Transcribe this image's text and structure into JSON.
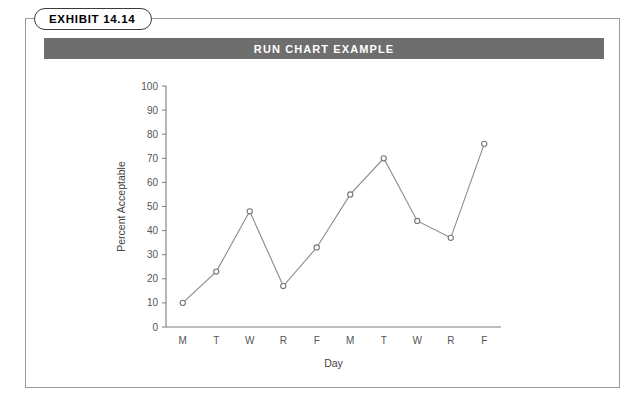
{
  "exhibit": {
    "tab_label": "EXHIBIT 14.14",
    "title": "RUN CHART EXAMPLE"
  },
  "colors": {
    "title_bar_bg": "#6e6e6e",
    "title_text": "#ffffff",
    "frame_border": "#9a9a9a",
    "axis": "#7d7d7d",
    "line": "#8a8a8a",
    "marker_fill": "#ffffff",
    "marker_stroke": "#777777",
    "tick_text": "#555555"
  },
  "chart_data": {
    "type": "line",
    "title": "RUN CHART EXAMPLE",
    "xlabel": "Day",
    "ylabel": "Percent Acceptable",
    "categories": [
      "M",
      "T",
      "W",
      "R",
      "F",
      "M",
      "T",
      "W",
      "R",
      "F"
    ],
    "values": [
      10,
      23,
      48,
      17,
      33,
      55,
      70,
      44,
      37,
      76
    ],
    "ylim": [
      0,
      100
    ],
    "yticks": [
      0,
      10,
      20,
      30,
      40,
      50,
      60,
      70,
      80,
      90,
      100
    ],
    "grid": false,
    "legend": "none",
    "markers": "open-circle"
  }
}
